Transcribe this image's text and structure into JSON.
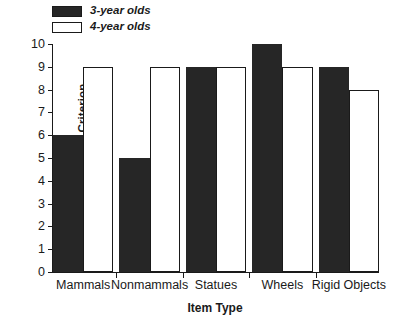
{
  "chart_data": {
    "type": "bar",
    "title": "",
    "xlabel": "Item Type",
    "ylabel": "N Children Meeting Criterion",
    "ylabel_italic_prefix": "N",
    "ylabel_rest": " Children Meeting Criterion",
    "categories": [
      "Mammals",
      "Nonmammals",
      "Statues",
      "Wheels",
      "Rigid Objects"
    ],
    "series": [
      {
        "name": "3-year olds",
        "values": [
          6,
          5,
          9,
          10,
          9
        ],
        "fill": "#262626",
        "style": "filled"
      },
      {
        "name": "4-year olds",
        "values": [
          9,
          9,
          9,
          9,
          8
        ],
        "fill": "#ffffff",
        "style": "hollow"
      }
    ],
    "ylim": [
      0,
      10
    ],
    "yticks": [
      0,
      1,
      2,
      3,
      4,
      5,
      6,
      7,
      8,
      9,
      10
    ],
    "ytick_labels": [
      "0",
      "1",
      "2",
      "3",
      "4",
      "5",
      "6",
      "7",
      "8",
      "9",
      "10"
    ],
    "grid": false,
    "legend_position": "top-left",
    "axis_color": "#1a1a1a",
    "background": "#ffffff"
  },
  "legend": {
    "items": [
      {
        "label": "3-year olds",
        "swatch": "filled"
      },
      {
        "label": "4-year olds",
        "swatch": "hollow"
      }
    ]
  }
}
